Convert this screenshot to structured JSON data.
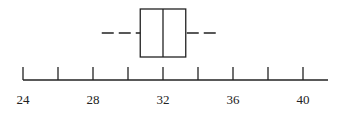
{
  "chart_data": {
    "type": "boxplot",
    "title": "",
    "xlabel": "",
    "ylabel": "",
    "xlim": [
      24,
      41.5
    ],
    "major_ticks": [
      24,
      26,
      28,
      30,
      32,
      34,
      36,
      38,
      40
    ],
    "tick_labels": [
      "24",
      "28",
      "32",
      "36",
      "40"
    ],
    "tick_label_values": [
      24,
      28,
      32,
      36,
      40
    ],
    "box": {
      "min": 28.5,
      "q1": 30.7,
      "median": 32,
      "q3": 33.3,
      "max": 35.1
    },
    "whisker_style": "dashed",
    "grid": false,
    "legend": null,
    "colors": {
      "stroke": "#222222",
      "background": "#ffffff"
    }
  }
}
